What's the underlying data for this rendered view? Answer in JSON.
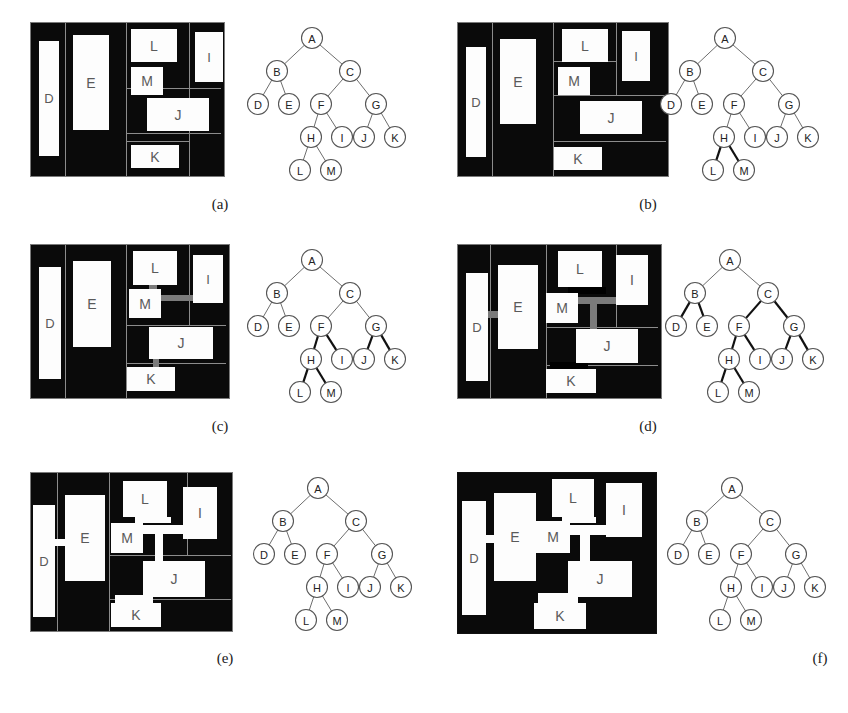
{
  "figure": {
    "type": "floorplan-slicing-tree-figure",
    "panel_count": 6,
    "block_labels": [
      "D",
      "E",
      "L",
      "M",
      "I",
      "J",
      "K"
    ],
    "tree_node_labels": [
      "A",
      "B",
      "C",
      "D",
      "E",
      "F",
      "G",
      "H",
      "I",
      "J",
      "K",
      "L",
      "M"
    ],
    "colors": {
      "background": "#ffffff",
      "floorplan_fill": "#0a0a0a",
      "block_fill": "#fdfdfd",
      "block_text": "#5a5a5a",
      "slice_line": "#8c8c8c",
      "connector_gray": "#7b7b7b",
      "connector_white": "#fdfdfd",
      "edge_normal": "#6e6e6e",
      "edge_bold": "#111111"
    }
  },
  "tree": {
    "nodes": [
      {
        "id": "A",
        "label": "A",
        "x": 60,
        "y": 12
      },
      {
        "id": "B",
        "label": "B",
        "x": 25,
        "y": 45
      },
      {
        "id": "C",
        "label": "C",
        "x": 98,
        "y": 45
      },
      {
        "id": "D",
        "label": "D",
        "x": 6,
        "y": 78
      },
      {
        "id": "E",
        "label": "E",
        "x": 37,
        "y": 78
      },
      {
        "id": "F",
        "label": "F",
        "x": 69,
        "y": 78
      },
      {
        "id": "G",
        "label": "G",
        "x": 124,
        "y": 78
      },
      {
        "id": "H",
        "label": "H",
        "x": 59,
        "y": 111
      },
      {
        "id": "I",
        "label": "I",
        "x": 90,
        "y": 111
      },
      {
        "id": "J",
        "label": "J",
        "x": 112,
        "y": 111
      },
      {
        "id": "K",
        "label": "K",
        "x": 143,
        "y": 111
      },
      {
        "id": "L",
        "label": "L",
        "x": 48,
        "y": 144
      },
      {
        "id": "M",
        "label": "M",
        "x": 79,
        "y": 144
      }
    ],
    "edges": [
      {
        "from": "A",
        "to": "B"
      },
      {
        "from": "A",
        "to": "C"
      },
      {
        "from": "B",
        "to": "D"
      },
      {
        "from": "B",
        "to": "E"
      },
      {
        "from": "C",
        "to": "F"
      },
      {
        "from": "C",
        "to": "G"
      },
      {
        "from": "F",
        "to": "H"
      },
      {
        "from": "F",
        "to": "I"
      },
      {
        "from": "G",
        "to": "J"
      },
      {
        "from": "G",
        "to": "K"
      },
      {
        "from": "H",
        "to": "L"
      },
      {
        "from": "H",
        "to": "M"
      }
    ]
  },
  "panels": [
    {
      "id": "a",
      "caption": "(a)",
      "floorplan": {
        "slice_lines": [
          {
            "o": "v",
            "p": 34
          },
          {
            "o": "v",
            "p": 95
          },
          {
            "o": "v",
            "p": 158
          },
          {
            "o": "h",
            "p": 65,
            "from": 95,
            "to": 190
          },
          {
            "o": "h",
            "p": 110,
            "from": 95,
            "to": 190
          },
          {
            "o": "h",
            "p": 118,
            "from": 95,
            "to": 158
          }
        ],
        "blocks": [
          {
            "label": "D",
            "x": 8,
            "y": 18,
            "w": 20,
            "h": 115
          },
          {
            "label": "E",
            "x": 42,
            "y": 12,
            "w": 36,
            "h": 95
          },
          {
            "label": "L",
            "x": 100,
            "y": 6,
            "w": 46,
            "h": 33
          },
          {
            "label": "M",
            "x": 100,
            "y": 44,
            "w": 32,
            "h": 28
          },
          {
            "label": "I",
            "x": 164,
            "y": 9,
            "w": 28,
            "h": 50
          },
          {
            "label": "J",
            "x": 116,
            "y": 75,
            "w": 62,
            "h": 33
          },
          {
            "label": "K",
            "x": 100,
            "y": 122,
            "w": 48,
            "h": 23
          }
        ],
        "connectors": []
      },
      "bold_edges": []
    },
    {
      "id": "b",
      "caption": "(b)",
      "floorplan": {
        "slice_lines": [
          {
            "o": "v",
            "p": 34
          },
          {
            "o": "v",
            "p": 95
          },
          {
            "o": "v",
            "p": 158,
            "from": 0,
            "to": 72
          },
          {
            "o": "h",
            "p": 72,
            "from": 95,
            "to": 208
          },
          {
            "o": "h",
            "p": 118,
            "from": 95,
            "to": 208
          },
          {
            "o": "h",
            "p": 38,
            "from": 95,
            "to": 158
          }
        ],
        "blocks": [
          {
            "label": "D",
            "x": 8,
            "y": 24,
            "w": 20,
            "h": 110
          },
          {
            "label": "E",
            "x": 42,
            "y": 16,
            "w": 36,
            "h": 85
          },
          {
            "label": "L",
            "x": 104,
            "y": 6,
            "w": 46,
            "h": 33
          },
          {
            "label": "M",
            "x": 100,
            "y": 44,
            "w": 32,
            "h": 28
          },
          {
            "label": "I",
            "x": 164,
            "y": 8,
            "w": 28,
            "h": 50
          },
          {
            "label": "J",
            "x": 122,
            "y": 78,
            "w": 62,
            "h": 33
          },
          {
            "label": "K",
            "x": 96,
            "y": 124,
            "w": 48,
            "h": 23
          }
        ],
        "connectors": []
      },
      "bold_edges": [
        "H-L",
        "H-M"
      ]
    },
    {
      "id": "c",
      "caption": "(c)",
      "floorplan": {
        "slice_lines": [
          {
            "o": "v",
            "p": 34
          },
          {
            "o": "v",
            "p": 95
          },
          {
            "o": "v",
            "p": 158,
            "from": 0,
            "to": 80
          },
          {
            "o": "h",
            "p": 80,
            "from": 95,
            "to": 195
          },
          {
            "o": "h",
            "p": 118,
            "from": 95,
            "to": 195
          }
        ],
        "blocks": [
          {
            "label": "D",
            "x": 8,
            "y": 22,
            "w": 22,
            "h": 112
          },
          {
            "label": "E",
            "x": 42,
            "y": 16,
            "w": 38,
            "h": 86
          },
          {
            "label": "L",
            "x": 102,
            "y": 6,
            "w": 44,
            "h": 34
          },
          {
            "label": "M",
            "x": 98,
            "y": 44,
            "w": 32,
            "h": 29
          },
          {
            "label": "I",
            "x": 162,
            "y": 10,
            "w": 30,
            "h": 48
          },
          {
            "label": "J",
            "x": 118,
            "y": 82,
            "w": 64,
            "h": 32
          },
          {
            "label": "K",
            "x": 96,
            "y": 122,
            "w": 48,
            "h": 24
          }
        ],
        "connectors": [
          {
            "style": "gray",
            "x": 118,
            "y": 36,
            "w": 8,
            "h": 10
          },
          {
            "style": "gray",
            "x": 126,
            "y": 50,
            "w": 38,
            "h": 6
          },
          {
            "style": "gray",
            "x": 122,
            "y": 112,
            "w": 6,
            "h": 12
          }
        ]
      },
      "bold_edges": [
        "F-H",
        "F-I",
        "G-J",
        "G-K",
        "H-L",
        "H-M"
      ]
    },
    {
      "id": "d",
      "caption": "(d)",
      "floorplan": {
        "slice_lines": [
          {
            "o": "v",
            "p": 32
          },
          {
            "o": "v",
            "p": 88
          },
          {
            "o": "v",
            "p": 158,
            "from": 0,
            "to": 82
          },
          {
            "o": "h",
            "p": 82,
            "from": 88,
            "to": 200
          },
          {
            "o": "h",
            "p": 120,
            "from": 88,
            "to": 200
          }
        ],
        "blocks": [
          {
            "label": "D",
            "x": 8,
            "y": 28,
            "w": 22,
            "h": 108
          },
          {
            "label": "E",
            "x": 40,
            "y": 20,
            "w": 40,
            "h": 84
          },
          {
            "label": "L",
            "x": 100,
            "y": 6,
            "w": 44,
            "h": 36
          },
          {
            "label": "M",
            "x": 88,
            "y": 48,
            "w": 32,
            "h": 30
          },
          {
            "label": "I",
            "x": 158,
            "y": 10,
            "w": 32,
            "h": 50
          },
          {
            "label": "J",
            "x": 118,
            "y": 84,
            "w": 62,
            "h": 34
          },
          {
            "label": "K",
            "x": 88,
            "y": 124,
            "w": 50,
            "h": 24
          }
        ],
        "connectors": [
          {
            "style": "gray",
            "x": 28,
            "y": 66,
            "w": 14,
            "h": 7
          },
          {
            "style": "black",
            "x": 110,
            "y": 42,
            "w": 38,
            "h": 7
          },
          {
            "style": "gray",
            "x": 120,
            "y": 52,
            "w": 38,
            "h": 7
          },
          {
            "style": "gray",
            "x": 132,
            "y": 58,
            "w": 7,
            "h": 28
          },
          {
            "style": "black",
            "x": 92,
            "y": 117,
            "w": 38,
            "h": 7
          },
          {
            "style": "black",
            "x": 118,
            "y": 112,
            "w": 8,
            "h": 14
          }
        ]
      },
      "bold_edges": [
        "B-D",
        "B-E",
        "C-F",
        "C-G",
        "F-H",
        "F-I",
        "G-J",
        "G-K",
        "H-L",
        "H-M"
      ]
    },
    {
      "id": "e",
      "caption": "(e)",
      "floorplan": {
        "slice_lines": [
          {
            "o": "v",
            "p": 26
          },
          {
            "o": "v",
            "p": 78
          },
          {
            "o": "v",
            "p": 156,
            "from": 0,
            "to": 82
          },
          {
            "o": "h",
            "p": 82,
            "from": 78,
            "to": 200
          },
          {
            "o": "h",
            "p": 126,
            "from": 78,
            "to": 200
          }
        ],
        "blocks": [
          {
            "label": "D",
            "x": 2,
            "y": 32,
            "w": 22,
            "h": 112
          },
          {
            "label": "E",
            "x": 34,
            "y": 22,
            "w": 40,
            "h": 86
          },
          {
            "label": "L",
            "x": 92,
            "y": 8,
            "w": 44,
            "h": 36
          },
          {
            "label": "M",
            "x": 80,
            "y": 50,
            "w": 32,
            "h": 30
          },
          {
            "label": "I",
            "x": 152,
            "y": 14,
            "w": 34,
            "h": 52
          },
          {
            "label": "J",
            "x": 112,
            "y": 88,
            "w": 62,
            "h": 36
          },
          {
            "label": "K",
            "x": 80,
            "y": 130,
            "w": 50,
            "h": 24
          }
        ],
        "connectors": [
          {
            "style": "white",
            "x": 22,
            "y": 66,
            "w": 14,
            "h": 7
          },
          {
            "style": "white",
            "x": 104,
            "y": 44,
            "w": 36,
            "h": 6
          },
          {
            "style": "white",
            "x": 110,
            "y": 52,
            "w": 44,
            "h": 9
          },
          {
            "style": "white",
            "x": 124,
            "y": 58,
            "w": 8,
            "h": 34
          },
          {
            "style": "white",
            "x": 84,
            "y": 122,
            "w": 38,
            "h": 8
          },
          {
            "style": "white",
            "x": 112,
            "y": 118,
            "w": 9,
            "h": 16
          }
        ]
      },
      "bold_edges": []
    },
    {
      "id": "f",
      "caption": "(f)",
      "floorplan": {
        "slice_lines": [],
        "blocks": [
          {
            "label": "D",
            "x": 4,
            "y": 28,
            "w": 24,
            "h": 114
          },
          {
            "label": "E",
            "x": 36,
            "y": 20,
            "w": 42,
            "h": 88
          },
          {
            "label": "L",
            "x": 94,
            "y": 6,
            "w": 42,
            "h": 38
          },
          {
            "label": "M",
            "x": 78,
            "y": 48,
            "w": 34,
            "h": 32
          },
          {
            "label": "I",
            "x": 148,
            "y": 10,
            "w": 36,
            "h": 54
          },
          {
            "label": "J",
            "x": 110,
            "y": 88,
            "w": 64,
            "h": 36
          },
          {
            "label": "K",
            "x": 76,
            "y": 130,
            "w": 52,
            "h": 26
          }
        ],
        "connectors": [
          {
            "style": "white",
            "x": 24,
            "y": 62,
            "w": 16,
            "h": 8
          },
          {
            "style": "white",
            "x": 104,
            "y": 44,
            "w": 34,
            "h": 6
          },
          {
            "style": "white",
            "x": 108,
            "y": 52,
            "w": 44,
            "h": 10
          },
          {
            "style": "white",
            "x": 122,
            "y": 60,
            "w": 10,
            "h": 32
          },
          {
            "style": "white",
            "x": 80,
            "y": 120,
            "w": 40,
            "h": 10
          },
          {
            "style": "white",
            "x": 110,
            "y": 116,
            "w": 10,
            "h": 18
          }
        ]
      },
      "bold_edges": []
    }
  ]
}
